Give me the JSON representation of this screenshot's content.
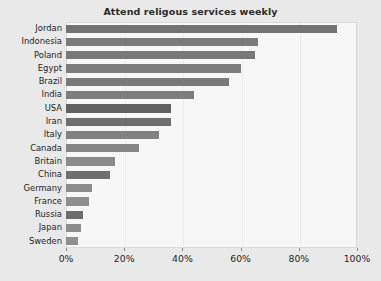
{
  "chart_data": {
    "type": "bar",
    "orientation": "horizontal",
    "title": "Attend religous services weekly",
    "xlabel": "",
    "ylabel": "",
    "xlim": [
      0,
      100
    ],
    "xticks": [
      0,
      20,
      40,
      60,
      80,
      100
    ],
    "xtick_labels": [
      "0%",
      "20%",
      "40%",
      "60%",
      "80%",
      "100%"
    ],
    "grid": true,
    "legend": "none",
    "bar_color": "#777777",
    "panel_color": "#f7f7f7",
    "figure_color": "#e9e9e9",
    "categories": [
      "Jordan",
      "Indonesia",
      "Poland",
      "Egypt",
      "Brazil",
      "India",
      "USA",
      "Iran",
      "Italy",
      "Canada",
      "Britain",
      "China",
      "Germany",
      "France",
      "Russia",
      "Japan",
      "Sweden"
    ],
    "values": [
      93,
      66,
      65,
      60,
      56,
      44,
      36,
      36,
      32,
      25,
      17,
      15,
      9,
      8,
      6,
      5,
      4
    ]
  }
}
